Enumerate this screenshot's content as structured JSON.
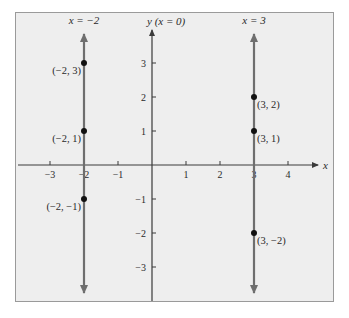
{
  "figure": {
    "background": "#ffffff",
    "panel_fill": "#eeeeee",
    "panel_border": "#9a9a9a",
    "axis_color": "#3a3a3a",
    "line_color": "#6e6e6e",
    "point_color": "#111111"
  },
  "axes": {
    "x_label": "x",
    "y_label": "y (x = 0)",
    "x_ticks": [
      {
        "value": -3,
        "label": "−3"
      },
      {
        "value": -2,
        "label": "−2"
      },
      {
        "value": -1,
        "label": "−1"
      },
      {
        "value": 1,
        "label": "1"
      },
      {
        "value": 2,
        "label": "2"
      },
      {
        "value": 3,
        "label": "3"
      },
      {
        "value": 4,
        "label": "4"
      }
    ],
    "y_ticks": [
      {
        "value": 3,
        "label": "3"
      },
      {
        "value": 2,
        "label": "2"
      },
      {
        "value": 1,
        "label": "1"
      },
      {
        "value": -1,
        "label": "−1"
      },
      {
        "value": -2,
        "label": "−2"
      },
      {
        "value": -3,
        "label": "−3"
      }
    ]
  },
  "lines": [
    {
      "label": "x = −2",
      "x": -2
    },
    {
      "label": "x = 3",
      "x": 3
    }
  ],
  "points": [
    {
      "label": "(−2, 3)",
      "x": -2,
      "y": 3,
      "side": "left"
    },
    {
      "label": "(−2, 1)",
      "x": -2,
      "y": 1,
      "side": "left"
    },
    {
      "label": "(−2, −1)",
      "x": -2,
      "y": -1,
      "side": "left"
    },
    {
      "label": "(3, 2)",
      "x": 3,
      "y": 2,
      "side": "right"
    },
    {
      "label": "(3, 1)",
      "x": 3,
      "y": 1,
      "side": "right"
    },
    {
      "label": "(3, −2)",
      "x": 3,
      "y": -2,
      "side": "right"
    }
  ]
}
